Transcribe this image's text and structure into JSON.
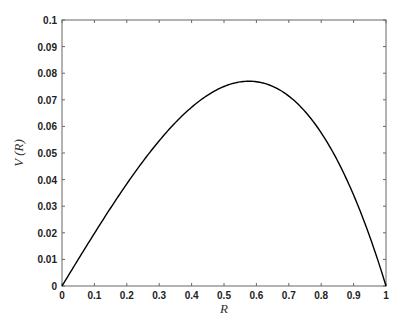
{
  "chart_data": {
    "type": "line",
    "title": "",
    "xlabel": "R",
    "ylabel": "V (R)",
    "xlim": [
      0,
      1
    ],
    "ylim": [
      0,
      0.1
    ],
    "grid": false,
    "legend": null,
    "x_ticks": [
      "0",
      "0.1",
      "0.2",
      "0.3",
      "0.4",
      "0.5",
      "0.6",
      "0.7",
      "0.8",
      "0.9",
      "1"
    ],
    "y_ticks": [
      "0",
      "0.01",
      "0.02",
      "0.03",
      "0.04",
      "0.05",
      "0.06",
      "0.07",
      "0.08",
      "0.09",
      "0.1"
    ],
    "series": [
      {
        "name": "V(R)",
        "color": "#000000",
        "x": [
          0,
          0.05,
          0.1,
          0.15,
          0.2,
          0.25,
          0.3,
          0.35,
          0.4,
          0.45,
          0.5,
          0.55,
          0.577,
          0.6,
          0.65,
          0.7,
          0.75,
          0.8,
          0.85,
          0.9,
          0.95,
          1.0
        ],
        "y": [
          0,
          0.00998,
          0.0198,
          0.02933,
          0.0384,
          0.04688,
          0.0546,
          0.06143,
          0.0672,
          0.07178,
          0.075,
          0.07673,
          0.077,
          0.0768,
          0.07508,
          0.0714,
          0.06563,
          0.0576,
          0.04717,
          0.0342,
          0.01853,
          0
        ]
      }
    ]
  }
}
